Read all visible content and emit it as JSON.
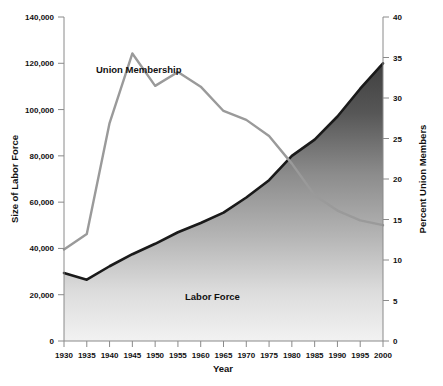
{
  "chart_data": {
    "type": "area",
    "title": "",
    "xlabel": "Year",
    "ylabel": "Size of Labor Force",
    "y2label": "Percent Union Members",
    "grid": false,
    "legend_position": "inline-annotations",
    "x": [
      1930,
      1935,
      1940,
      1945,
      1950,
      1955,
      1960,
      1965,
      1970,
      1975,
      1980,
      1985,
      1990,
      1995,
      2000
    ],
    "xlim": [
      1930,
      2000
    ],
    "xtick_labels": [
      "1930",
      "1935",
      "1940",
      "1945",
      "1950",
      "1955",
      "1960",
      "1965",
      "1970",
      "1975",
      "1980",
      "1985",
      "1990",
      "1995",
      "2000"
    ],
    "ylim": [
      0,
      140000
    ],
    "ytick_labels": [
      "0",
      "20,000",
      "40,000",
      "60,000",
      "80,000",
      "100,000",
      "120,000",
      "140,000"
    ],
    "ytick_values": [
      0,
      20000,
      40000,
      60000,
      80000,
      100000,
      120000,
      140000
    ],
    "y2lim": [
      0,
      40
    ],
    "y2tick_labels": [
      "0",
      "5",
      "10",
      "15",
      "20",
      "25",
      "30",
      "35",
      "40"
    ],
    "y2tick_values": [
      0,
      5,
      10,
      15,
      20,
      25,
      30,
      35,
      40
    ],
    "series": [
      {
        "name": "Labor Force",
        "axis": "left",
        "render": "area",
        "units": "thousands of workers",
        "values": [
          29400,
          26500,
          32300,
          37500,
          42000,
          47000,
          51000,
          55500,
          62000,
          69500,
          80000,
          87000,
          97000,
          109000,
          120000
        ]
      },
      {
        "name": "Union Membership",
        "axis": "right",
        "render": "line",
        "units": "percent of labor force",
        "values": [
          11.3,
          13.2,
          26.9,
          35.5,
          31.5,
          33.2,
          31.4,
          28.4,
          27.3,
          25.3,
          21.9,
          18.0,
          16.1,
          14.9,
          14.3
        ]
      }
    ],
    "annotations": [
      {
        "text": "Union Membership",
        "x": 1940,
        "y2": 35.5
      },
      {
        "text": "Labor Force",
        "x": 1960,
        "y": 20000
      }
    ],
    "colors": {
      "union_line": "#9a9a9a",
      "labor_force_edge": "#1a1a1a",
      "area_gradient_top": "#4a4a4a",
      "area_gradient_bottom": "#f0f0f0",
      "axis": "#8a8a8a",
      "text": "#111111",
      "background": "#ffffff"
    }
  }
}
